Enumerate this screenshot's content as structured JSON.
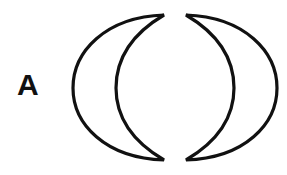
{
  "figure": {
    "panel_label": "A",
    "shapes": [
      {
        "name": "left-crescent",
        "orientation": "opens-right"
      },
      {
        "name": "right-crescent",
        "orientation": "opens-left"
      }
    ],
    "colors": {
      "stroke": "#111111",
      "background": "#ffffff"
    }
  }
}
